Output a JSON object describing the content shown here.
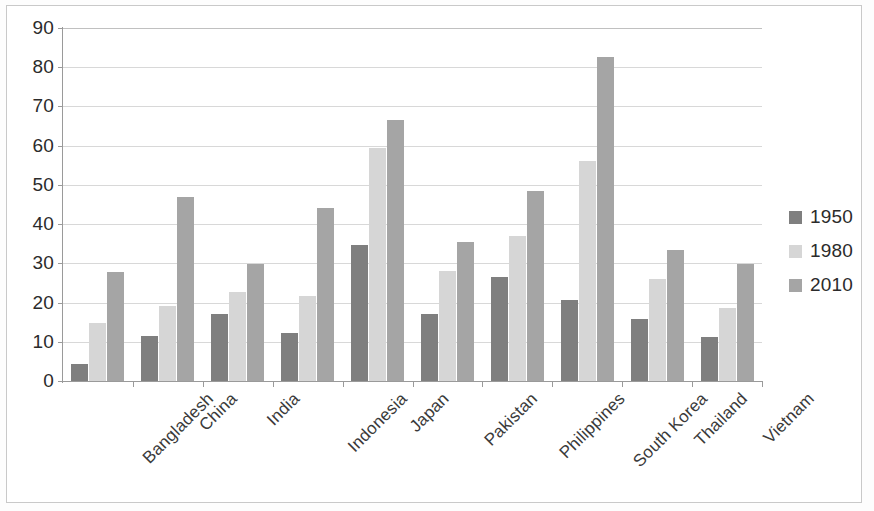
{
  "chart_data": {
    "type": "bar",
    "title": "",
    "subtitle": "",
    "xlabel": "",
    "ylabel": "",
    "ylim": [
      0,
      90
    ],
    "ytick_step": 10,
    "yticks": [
      "0",
      "10",
      "20",
      "30",
      "40",
      "50",
      "60",
      "70",
      "80",
      "90"
    ],
    "grid": true,
    "legend_position": "right",
    "categories": [
      "Bangladesh",
      "China",
      "India",
      "Indonesia",
      "Japan",
      "Pakistan",
      "Philippines",
      "South Korea",
      "Thailand",
      "Vietnam"
    ],
    "series": [
      {
        "name": "1950",
        "color": "#7f7f7f",
        "values": [
          4.3,
          11.6,
          17.0,
          12.2,
          34.6,
          17.0,
          26.4,
          20.7,
          15.8,
          11.3
        ]
      },
      {
        "name": "1980",
        "color": "#d6d6d6",
        "values": [
          14.9,
          19.1,
          22.6,
          21.6,
          59.4,
          28.0,
          37.1,
          56.1,
          26.0,
          18.5
        ]
      },
      {
        "name": "2010",
        "color": "#a5a5a5",
        "values": [
          27.9,
          47.0,
          29.9,
          44.0,
          66.6,
          35.5,
          48.4,
          82.5,
          33.5,
          29.8
        ]
      }
    ]
  },
  "legend": {
    "entries": [
      {
        "label": "1950",
        "color": "#7f7f7f"
      },
      {
        "label": "1980",
        "color": "#d6d6d6"
      },
      {
        "label": "2010",
        "color": "#a5a5a5"
      }
    ]
  }
}
